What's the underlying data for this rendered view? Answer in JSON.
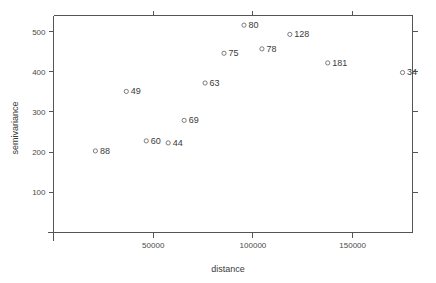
{
  "chart_data": {
    "type": "scatter",
    "title": "",
    "xlabel": "distance",
    "ylabel": "semivariance",
    "xlim": [
      0,
      180000
    ],
    "ylim": [
      0,
      540
    ],
    "grid": false,
    "legend": "none",
    "point_labels_shown": true,
    "marker": "open-circle",
    "xticks": [
      50000,
      100000,
      150000
    ],
    "xtick_labels": [
      "50000",
      "100000",
      "150000"
    ],
    "yticks": [
      100,
      200,
      300,
      400,
      500
    ],
    "ytick_labels": [
      "100",
      "200",
      "300",
      "400",
      "500"
    ],
    "points": [
      {
        "label": "88",
        "x": 21000,
        "y": 203
      },
      {
        "label": "49",
        "x": 36500,
        "y": 351
      },
      {
        "label": "60",
        "x": 46500,
        "y": 228
      },
      {
        "label": "44",
        "x": 57500,
        "y": 223
      },
      {
        "label": "69",
        "x": 65500,
        "y": 279
      },
      {
        "label": "63",
        "x": 76000,
        "y": 372
      },
      {
        "label": "75",
        "x": 85500,
        "y": 446
      },
      {
        "label": "80",
        "x": 95500,
        "y": 516
      },
      {
        "label": "78",
        "x": 104500,
        "y": 457
      },
      {
        "label": "128",
        "x": 118500,
        "y": 493
      },
      {
        "label": "181",
        "x": 137500,
        "y": 422
      },
      {
        "label": "34",
        "x": 175000,
        "y": 398
      }
    ]
  },
  "colors": {
    "axis": "#555555",
    "marker": "#6e6e6e",
    "text": "#3a3a3a",
    "background": "#ffffff"
  }
}
